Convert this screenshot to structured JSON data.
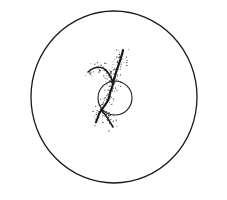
{
  "figure": {
    "colors": {
      "background": "#ffffff",
      "ink": "#1a1a1a",
      "stipple": "#333333"
    },
    "outer_circle": {
      "cx": 114,
      "cy": 97,
      "rx": 83,
      "ry": 86,
      "stroke_width": 1.3
    },
    "inner_circle": {
      "cx": 115,
      "cy": 98,
      "r": 17,
      "stroke_width": 1.1
    },
    "filaments": [
      {
        "name": "main-strand",
        "path": "M123,50 C121,60 117,68 115,76 C113,82 113,86 111,90 C109,95 110,98 107,102 C104,107 101,110 99,114 C98,117 97,120 96,122"
      },
      {
        "name": "left-branch",
        "path": "M88,72 C92,68 98,66 103,68 C108,71 111,76 113,83"
      },
      {
        "name": "lower-right-branch",
        "path": "M101,109 C105,114 109,120 113,127"
      }
    ]
  }
}
